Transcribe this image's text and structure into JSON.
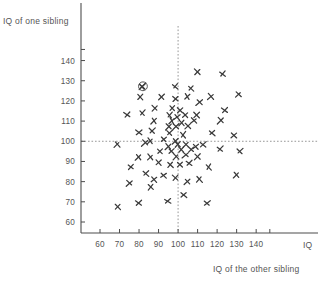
{
  "figure": {
    "y_axis_title": "IQ of one sibling",
    "x_axis_title": "IQ of the other sibling",
    "x_axis_unit_label": "IQ"
  },
  "chart_data": {
    "type": "scatter",
    "title": "",
    "xlabel": "IQ of the other sibling",
    "ylabel": "IQ of one sibling",
    "xlim": [
      52,
      148
    ],
    "ylim": [
      52,
      148
    ],
    "xticks": [
      60,
      70,
      80,
      90,
      100,
      110,
      120,
      130,
      140
    ],
    "yticks": [
      60,
      70,
      80,
      90,
      100,
      110,
      120,
      130,
      140
    ],
    "grid": false,
    "legend": null,
    "marker": "x",
    "marker_color": "#3a3a3a",
    "reference_lines": [
      {
        "orientation": "vertical",
        "value": 100,
        "style": "dashed",
        "color": "#8c8c8c"
      },
      {
        "orientation": "horizontal",
        "value": 100,
        "style": "dashed",
        "color": "#8c8c8c"
      }
    ],
    "highlighted_point": {
      "x": 82,
      "y": 127,
      "annotation": "circled"
    },
    "points": [
      {
        "x": 110,
        "y": 134
      },
      {
        "x": 123,
        "y": 133
      },
      {
        "x": 82,
        "y": 127
      },
      {
        "x": 99,
        "y": 127
      },
      {
        "x": 107,
        "y": 126
      },
      {
        "x": 81,
        "y": 122
      },
      {
        "x": 92,
        "y": 122
      },
      {
        "x": 99,
        "y": 121
      },
      {
        "x": 105,
        "y": 122
      },
      {
        "x": 117,
        "y": 122
      },
      {
        "x": 131,
        "y": 123
      },
      {
        "x": 111,
        "y": 119
      },
      {
        "x": 88,
        "y": 116
      },
      {
        "x": 97,
        "y": 116
      },
      {
        "x": 101,
        "y": 115
      },
      {
        "x": 124,
        "y": 115
      },
      {
        "x": 74,
        "y": 113
      },
      {
        "x": 82,
        "y": 114
      },
      {
        "x": 96,
        "y": 113
      },
      {
        "x": 100,
        "y": 112
      },
      {
        "x": 104,
        "y": 113
      },
      {
        "x": 110,
        "y": 113
      },
      {
        "x": 88,
        "y": 110
      },
      {
        "x": 97,
        "y": 110
      },
      {
        "x": 102,
        "y": 109
      },
      {
        "x": 108,
        "y": 110
      },
      {
        "x": 122,
        "y": 110
      },
      {
        "x": 95,
        "y": 107
      },
      {
        "x": 99,
        "y": 107
      },
      {
        "x": 105,
        "y": 107
      },
      {
        "x": 80,
        "y": 104
      },
      {
        "x": 87,
        "y": 105
      },
      {
        "x": 96,
        "y": 104
      },
      {
        "x": 103,
        "y": 103
      },
      {
        "x": 118,
        "y": 104
      },
      {
        "x": 129,
        "y": 103
      },
      {
        "x": 93,
        "y": 101
      },
      {
        "x": 99,
        "y": 100
      },
      {
        "x": 86,
        "y": 100
      },
      {
        "x": 69,
        "y": 98
      },
      {
        "x": 83,
        "y": 99
      },
      {
        "x": 95,
        "y": 97
      },
      {
        "x": 100,
        "y": 98
      },
      {
        "x": 104,
        "y": 98
      },
      {
        "x": 109,
        "y": 97
      },
      {
        "x": 113,
        "y": 98
      },
      {
        "x": 122,
        "y": 96
      },
      {
        "x": 132,
        "y": 95
      },
      {
        "x": 91,
        "y": 95
      },
      {
        "x": 97,
        "y": 95
      },
      {
        "x": 102,
        "y": 96
      },
      {
        "x": 107,
        "y": 96
      },
      {
        "x": 80,
        "y": 92
      },
      {
        "x": 86,
        "y": 92
      },
      {
        "x": 99,
        "y": 92
      },
      {
        "x": 104,
        "y": 93
      },
      {
        "x": 110,
        "y": 92
      },
      {
        "x": 90,
        "y": 89
      },
      {
        "x": 96,
        "y": 88
      },
      {
        "x": 101,
        "y": 88
      },
      {
        "x": 106,
        "y": 89
      },
      {
        "x": 76,
        "y": 87
      },
      {
        "x": 116,
        "y": 87
      },
      {
        "x": 84,
        "y": 84
      },
      {
        "x": 93,
        "y": 83
      },
      {
        "x": 99,
        "y": 82
      },
      {
        "x": 88,
        "y": 81
      },
      {
        "x": 105,
        "y": 80
      },
      {
        "x": 111,
        "y": 81
      },
      {
        "x": 130,
        "y": 83
      },
      {
        "x": 75,
        "y": 79
      },
      {
        "x": 86,
        "y": 77
      },
      {
        "x": 103,
        "y": 73
      },
      {
        "x": 69,
        "y": 67
      },
      {
        "x": 80,
        "y": 69
      },
      {
        "x": 95,
        "y": 70
      },
      {
        "x": 115,
        "y": 69
      }
    ]
  }
}
